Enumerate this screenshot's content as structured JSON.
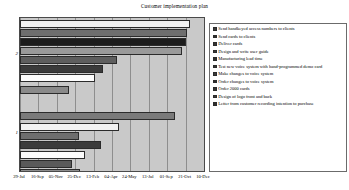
{
  "chart_data": {
    "type": "bar",
    "orientation": "horizontal",
    "title": "Customer implementation plan",
    "xlabel": "",
    "ylabel": "",
    "grid": true,
    "legend_position": "right",
    "x_axis": {
      "tick_labels": [
        "29-Jul",
        "16-Sep",
        "05-Nov",
        "25-Dec",
        "13-Feb",
        "04-Apr",
        "24-May",
        "13-Jul",
        "01-Sep",
        "21-Oct",
        "10-Dec"
      ],
      "tick_positions": [
        0,
        10,
        20,
        30,
        40,
        50,
        60,
        70,
        80,
        90,
        100
      ],
      "xlim": [
        0,
        100
      ]
    },
    "y_axis": {
      "group_labels": [
        "2",
        "1"
      ],
      "group_label_positions": [
        76,
        24
      ]
    },
    "categories": [
      "Send handkeyed access numbers to clients",
      "Send cards to clients",
      "Deliver cards",
      "Design and write user guide",
      "Manufacturing lead time",
      "Test new voice system with hand-programmed demo card",
      "Make changes to voice system",
      "Order changes to voice system",
      "Order 2000 cards",
      "Design of logo front and back",
      "Letter from customer recording intention to purchase"
    ],
    "values": [
      92.5,
      91.0,
      90.0,
      88.0,
      52.5,
      45.0,
      26.5,
      0,
      84.0,
      54.0,
      32.0
    ],
    "series": [
      {
        "name": "Customer implementation plan",
        "bars": [
          {
            "label": "Send handkeyed access numbers to clients",
            "value": 92.5,
            "fill": "#f2f2f2",
            "top": 2,
            "height": 8
          },
          {
            "label": "Send cards to clients",
            "value": 91.0,
            "fill": "#6e6e6e",
            "top": 11,
            "height": 8
          },
          {
            "label": "Deliver cards",
            "value": 90.0,
            "fill": "#1c1c1c",
            "top": 20,
            "height": 8
          },
          {
            "label": "Design and write user guide",
            "value": 88.0,
            "fill": "#9a9a9a",
            "top": 29,
            "height": 8
          },
          {
            "label": "Manufacturing lead time",
            "value": 52.5,
            "fill": "#5e5e5e",
            "top": 38,
            "height": 8
          },
          {
            "label": "Test new voice system with hand-programmed demo card",
            "value": 45.0,
            "fill": "#3a3a3a",
            "top": 47,
            "height": 8
          },
          {
            "label": "Make changes to voice system",
            "value": 41.0,
            "fill": "#fcfcfc",
            "top": 56,
            "height": 8
          },
          {
            "label": "Order changes to voice system",
            "value": 26.5,
            "fill": "#8a8a8a",
            "top": 68,
            "height": 8
          },
          {
            "label": "Order 2000 cards",
            "value": 84.0,
            "fill": "#7a7a7a",
            "top": 94,
            "height": 8
          },
          {
            "label": "Design of logo front and back",
            "value": 54.0,
            "fill": "#f2f2f2",
            "top": 105,
            "height": 8
          },
          {
            "label": "Letter from customer recording intention to purchase",
            "value": 32.0,
            "fill": "#6e6e6e",
            "top": 114,
            "height": 8
          },
          {
            "label": "bar-12",
            "value": 44.0,
            "fill": "#3c3c3c",
            "top": 123,
            "height": 8
          },
          {
            "label": "bar-13",
            "value": 35.5,
            "fill": "#fcfcfc",
            "top": 133,
            "height": 8
          },
          {
            "label": "bar-14",
            "value": 28.0,
            "fill": "#5a5a5a",
            "top": 142,
            "height": 8
          },
          {
            "label": "bar-15",
            "value": 32.5,
            "fill": "#8e8e8e",
            "top": 151,
            "height": 7
          }
        ]
      }
    ]
  },
  "legend": {
    "items": [
      {
        "label": "Send handkeyed access numbers to clients",
        "color": "#3a3a3a"
      },
      {
        "label": "Send cards to clients",
        "color": "#2e2e2e"
      },
      {
        "label": "Deliver cards",
        "color": "#333333"
      },
      {
        "label": "Design and write user guide",
        "color": "#3a3a3a"
      },
      {
        "label": "Manufacturing lead time",
        "color": "#2e2e2e"
      },
      {
        "label": "Test new voice system with hand-programmed demo card",
        "color": "#333333"
      },
      {
        "label": "Make changes to voice system",
        "color": "#3a3a3a"
      },
      {
        "label": "Order changes to voice system",
        "color": "#2e2e2e"
      },
      {
        "label": "Order 2000 cards",
        "color": "#333333"
      },
      {
        "label": "Design of logo front and back",
        "color": "#3a3a3a"
      },
      {
        "label": "Letter from customer recording intention to purchase",
        "color": "#2e2e2e"
      }
    ]
  }
}
